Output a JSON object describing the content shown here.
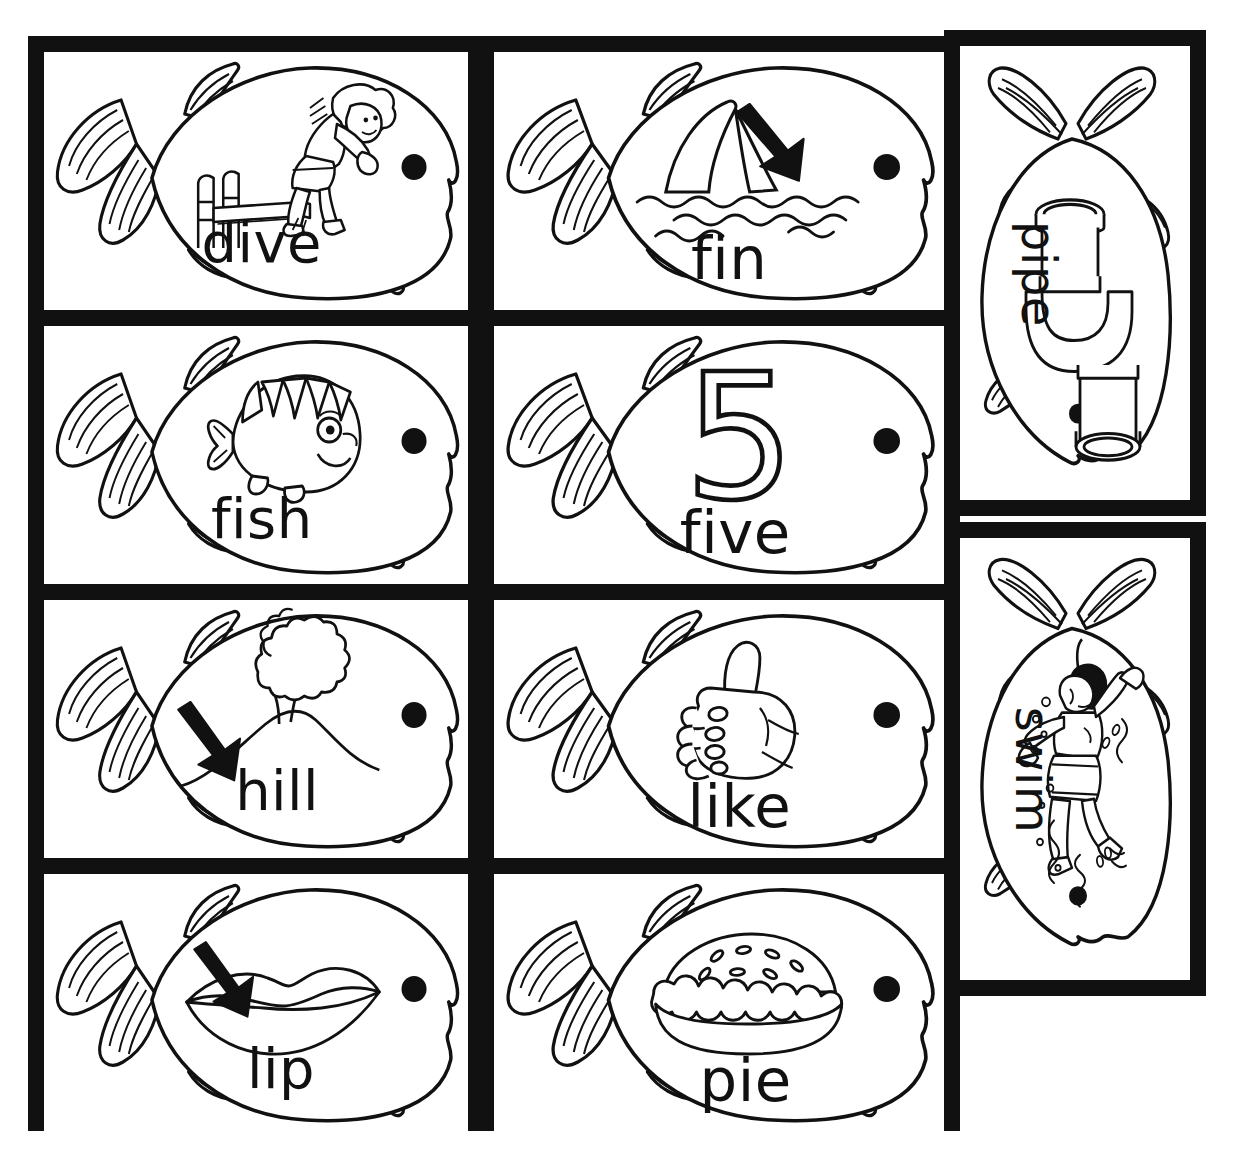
{
  "page": {
    "background_color": "#ffffff",
    "ink_color": "#111111",
    "frame_color": "#111111"
  },
  "layout": {
    "columns_left": 2,
    "rows_left": 4,
    "columns_right": 1,
    "rows_right": 2,
    "orientation_left": "horizontal",
    "orientation_right": "vertical"
  },
  "cards": [
    {
      "id": "dive",
      "word": "dive",
      "picture": "child-diving-off-diving-board",
      "has_arrow": false,
      "orientation": "horizontal",
      "row": 1,
      "col": 1
    },
    {
      "id": "fin",
      "word": "fin",
      "picture": "shark-fin-above-waves",
      "has_arrow": true,
      "orientation": "horizontal",
      "row": 1,
      "col": 2
    },
    {
      "id": "fish",
      "word": "fish",
      "picture": "smiling-cartoon-fish",
      "has_arrow": false,
      "orientation": "horizontal",
      "row": 2,
      "col": 1
    },
    {
      "id": "five",
      "word": "five",
      "picture": "numeral-5",
      "numeral": "5",
      "has_arrow": false,
      "orientation": "horizontal",
      "row": 2,
      "col": 2
    },
    {
      "id": "hill",
      "word": "hill",
      "picture": "tree-on-hill",
      "has_arrow": true,
      "orientation": "horizontal",
      "row": 3,
      "col": 1
    },
    {
      "id": "like",
      "word": "like",
      "picture": "thumbs-up-hand",
      "has_arrow": false,
      "orientation": "horizontal",
      "row": 3,
      "col": 2
    },
    {
      "id": "lip",
      "word": "lip",
      "picture": "pair-of-lips",
      "has_arrow": true,
      "orientation": "horizontal",
      "row": 4,
      "col": 1
    },
    {
      "id": "pie",
      "word": "pie",
      "picture": "baked-pie-in-dish",
      "has_arrow": false,
      "orientation": "horizontal",
      "row": 4,
      "col": 2
    },
    {
      "id": "pipe",
      "word": "pipe",
      "picture": "bent-metal-pipe",
      "has_arrow": false,
      "orientation": "vertical",
      "row": 1,
      "col": 3
    },
    {
      "id": "swim",
      "word": "swim",
      "picture": "child-swimming-in-water",
      "has_arrow": false,
      "orientation": "vertical",
      "row": 2,
      "col": 3
    }
  ]
}
